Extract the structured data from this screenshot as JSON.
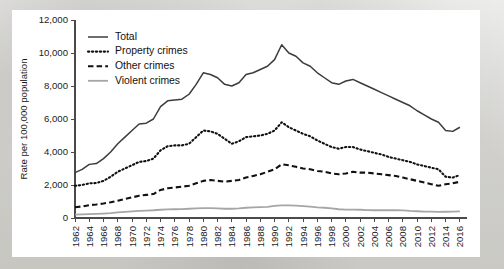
{
  "figure": {
    "background_color": "#ffffff",
    "page_background_color": "#e8e8e6"
  },
  "chart_data": {
    "type": "line",
    "title": "",
    "xlabel": "",
    "ylabel": "Rate per 100,000 population",
    "xlim": [
      1962,
      2017
    ],
    "ylim": [
      0,
      12000
    ],
    "grid": false,
    "legend_position": "top-left",
    "y_ticks": [
      0,
      2000,
      4000,
      6000,
      8000,
      10000,
      12000
    ],
    "y_tick_labels": [
      "0",
      "2,000",
      "4,000",
      "6,000",
      "8,000",
      "10,000",
      "12,000"
    ],
    "x_ticks": [
      1962,
      1964,
      1966,
      1968,
      1970,
      1972,
      1974,
      1976,
      1978,
      1980,
      1982,
      1984,
      1986,
      1988,
      1990,
      1992,
      1994,
      1996,
      1998,
      2000,
      2002,
      2004,
      2006,
      2008,
      2010,
      2012,
      2014,
      2016
    ],
    "x_tick_labels": [
      "1962",
      "1964",
      "1966",
      "1968",
      "1970",
      "1972",
      "1974",
      "1976",
      "1978",
      "1980",
      "1982",
      "1984",
      "1986",
      "1988",
      "1990",
      "1992",
      "1994",
      "1996",
      "1998",
      "2000",
      "2002",
      "2004",
      "2006",
      "2008",
      "2010",
      "2012",
      "2014",
      "2016"
    ],
    "x": [
      1962,
      1963,
      1964,
      1965,
      1966,
      1967,
      1968,
      1969,
      1970,
      1971,
      1972,
      1973,
      1974,
      1975,
      1976,
      1977,
      1978,
      1979,
      1980,
      1981,
      1982,
      1983,
      1984,
      1985,
      1986,
      1987,
      1988,
      1989,
      1990,
      1991,
      1992,
      1993,
      1994,
      1995,
      1996,
      1997,
      1998,
      1999,
      2000,
      2001,
      2002,
      2003,
      2004,
      2005,
      2006,
      2007,
      2008,
      2009,
      2010,
      2011,
      2012,
      2013,
      2014,
      2015,
      2016
    ],
    "series": [
      {
        "name": "Total",
        "style": "solid",
        "color": "#3c3c3c",
        "width": 1.5,
        "values": [
          2750,
          2950,
          3250,
          3300,
          3600,
          4000,
          4500,
          4900,
          5300,
          5700,
          5750,
          6000,
          6750,
          7100,
          7150,
          7200,
          7500,
          8100,
          8800,
          8700,
          8500,
          8100,
          8000,
          8200,
          8700,
          8800,
          9000,
          9200,
          9600,
          10500,
          10000,
          9800,
          9400,
          9200,
          8800,
          8500,
          8200,
          8100,
          8300,
          8400,
          8200,
          8000,
          7800,
          7600,
          7400,
          7200,
          7000,
          6800,
          6500,
          6250,
          6000,
          5800,
          5300,
          5250,
          5500
        ]
      },
      {
        "name": "Property crimes",
        "style": "dotted",
        "color": "#111111",
        "width": 2.1,
        "values": [
          1950,
          2000,
          2100,
          2120,
          2250,
          2500,
          2800,
          3000,
          3200,
          3400,
          3450,
          3600,
          4100,
          4350,
          4400,
          4400,
          4500,
          4900,
          5300,
          5250,
          5100,
          4800,
          4500,
          4650,
          4900,
          4950,
          5000,
          5100,
          5300,
          5800,
          5500,
          5300,
          5100,
          4950,
          4700,
          4500,
          4300,
          4200,
          4300,
          4300,
          4150,
          4050,
          3950,
          3850,
          3700,
          3600,
          3500,
          3400,
          3250,
          3150,
          3050,
          2950,
          2500,
          2450,
          2600
        ]
      },
      {
        "name": "Other crimes",
        "style": "dashed",
        "color": "#111111",
        "width": 2.1,
        "values": [
          650,
          700,
          780,
          820,
          880,
          950,
          1050,
          1150,
          1250,
          1350,
          1400,
          1450,
          1700,
          1800,
          1850,
          1900,
          1950,
          2100,
          2250,
          2300,
          2250,
          2200,
          2250,
          2300,
          2450,
          2550,
          2650,
          2800,
          2950,
          3250,
          3200,
          3100,
          3000,
          2950,
          2850,
          2800,
          2700,
          2650,
          2700,
          2800,
          2750,
          2750,
          2700,
          2650,
          2600,
          2550,
          2450,
          2350,
          2250,
          2150,
          2050,
          1950,
          2050,
          2100,
          2200
        ]
      },
      {
        "name": "Violent crimes",
        "style": "solid",
        "color": "#a6a6a6",
        "width": 1.8,
        "values": [
          200,
          215,
          230,
          250,
          270,
          300,
          340,
          370,
          400,
          430,
          450,
          470,
          500,
          520,
          530,
          540,
          560,
          580,
          600,
          600,
          580,
          560,
          560,
          580,
          620,
          640,
          660,
          680,
          730,
          760,
          760,
          750,
          720,
          690,
          640,
          620,
          580,
          530,
          510,
          510,
          500,
          480,
          470,
          470,
          480,
          470,
          460,
          430,
          410,
          390,
          390,
          370,
          380,
          390,
          400
        ]
      }
    ]
  },
  "legend": {
    "items": [
      {
        "label": "Total"
      },
      {
        "label": "Property crimes"
      },
      {
        "label": "Other crimes"
      },
      {
        "label": "Violent crimes"
      }
    ]
  }
}
